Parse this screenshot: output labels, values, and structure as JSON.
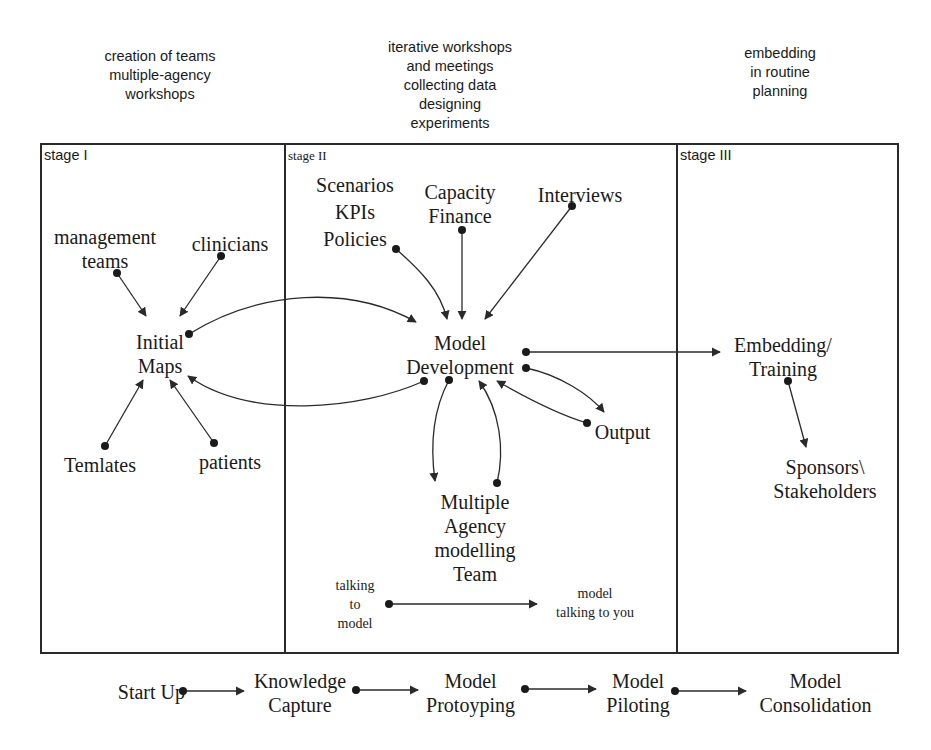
{
  "headers": {
    "stage1": "creation of teams\nmultiple-agency\nworkshops",
    "stage2": "iterative workshops\nand meetings\ncollecting data\ndesigning\nexperiments",
    "stage3": "embedding\nin routine\nplanning"
  },
  "stages": [
    {
      "label": "stage I"
    },
    {
      "label": "stage II"
    },
    {
      "label": "stage III"
    }
  ],
  "stage1_nodes": {
    "management_teams": "management\nteams",
    "clinicians": "clinicians",
    "initial_maps": "Initial\nMaps",
    "templates": "Temlates",
    "patients": "patients"
  },
  "stage2_nodes": {
    "scenarios": "Scenarios\nKPIs\nPolicies",
    "capacity": "Capacity\nFinance",
    "interviews": "Interviews",
    "model_development": "Model\nDevelopment",
    "output": "Output",
    "team": "Multiple\nAgency\nmodelling\nTeam",
    "talking_to_model": "talking\nto\nmodel",
    "model_talking": "model\ntalking to you"
  },
  "stage3_nodes": {
    "embedding": "Embedding/\nTraining",
    "sponsors": "Sponsors\\\nStakeholders"
  },
  "phases": [
    {
      "label": "Start Up"
    },
    {
      "label": "Knowledge\nCapture"
    },
    {
      "label": "Model\nProtoyping"
    },
    {
      "label": "Model\nPiloting"
    },
    {
      "label": "Model\nConsolidation"
    }
  ],
  "colors": {
    "line": "#2a2a2a",
    "background": "#ffffff"
  }
}
